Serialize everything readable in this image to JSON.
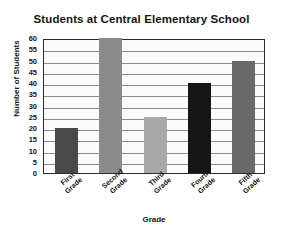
{
  "chart_data": {
    "type": "bar",
    "title": "Students at Central Elementary School",
    "xlabel": "Grade",
    "ylabel": "Number of Students",
    "categories": [
      "First Grade",
      "Second Grade",
      "Third Grade",
      "Fourth Grade",
      "Fifth Grade"
    ],
    "category_lines": [
      [
        "First",
        "Grade"
      ],
      [
        "Second",
        "Grade"
      ],
      [
        "Third",
        "Grade"
      ],
      [
        "Fourth",
        "Grade"
      ],
      [
        "Fifth",
        "Grade"
      ]
    ],
    "values": [
      20,
      60,
      25,
      40,
      50
    ],
    "bar_colors": [
      "#4a4a4a",
      "#8a8a8a",
      "#a8a8a8",
      "#151515",
      "#686868"
    ],
    "ylim": [
      0,
      60
    ],
    "ytick_step": 5,
    "ytick_labels": [
      "60",
      "55",
      "50",
      "45",
      "40",
      "35",
      "30",
      "25",
      "20",
      "15",
      "10",
      "5",
      "0"
    ],
    "grid": true,
    "legend": false,
    "plot_background": "#fbfbfb",
    "axis_color": "#2b2b2b",
    "gridline_color": "#8c8c8c"
  }
}
